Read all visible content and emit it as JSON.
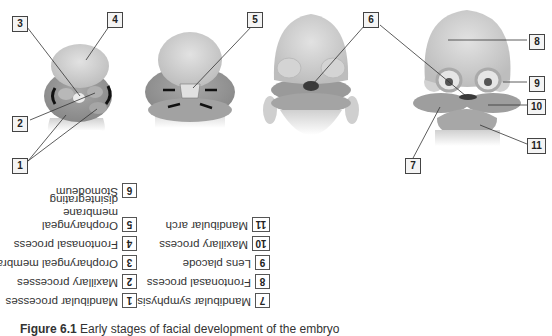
{
  "figure": {
    "callouts": [
      {
        "num": "1",
        "x": 12,
        "y": 158
      },
      {
        "num": "2",
        "x": 12,
        "y": 116
      },
      {
        "num": "3",
        "x": 12,
        "y": 16
      },
      {
        "num": "4",
        "x": 107,
        "y": 12
      },
      {
        "num": "5",
        "x": 247,
        "y": 12
      },
      {
        "num": "6",
        "x": 363,
        "y": 12
      },
      {
        "num": "7",
        "x": 405,
        "y": 158
      },
      {
        "num": "8",
        "x": 529,
        "y": 34
      },
      {
        "num": "9",
        "x": 529,
        "y": 76
      },
      {
        "num": "10",
        "x": 527,
        "y": 99
      },
      {
        "num": "11",
        "x": 527,
        "y": 138
      }
    ]
  },
  "legend": {
    "orientation": "rotated-180",
    "items": [
      {
        "num": "1",
        "text": "Mandibular processes"
      },
      {
        "num": "2",
        "text": "Maxillary processes"
      },
      {
        "num": "3",
        "text": "Oropharyngeal membrane"
      },
      {
        "num": "4",
        "text": "Frontonasal process"
      },
      {
        "num": "5",
        "text": "Oropharyngeal membrane disintegrating"
      },
      {
        "num": "6",
        "text": "Stomodeum"
      },
      {
        "num": "7",
        "text": "Mandibular symphysis"
      },
      {
        "num": "8",
        "text": "Frontonasal process"
      },
      {
        "num": "9",
        "text": "Lens placode"
      },
      {
        "num": "10",
        "text": "Maxillary process"
      },
      {
        "num": "11",
        "text": "Mandibular arch"
      }
    ]
  },
  "caption": {
    "label": "Figure 6.1",
    "text": "Early stages of facial development of the embryo"
  },
  "colors": {
    "tissue_light": "#d6d6d6",
    "tissue_mid": "#a9a9a9",
    "tissue_dark": "#8a8a8a",
    "stomodeum": "#3a3a3a",
    "leader_line": "#333333"
  }
}
